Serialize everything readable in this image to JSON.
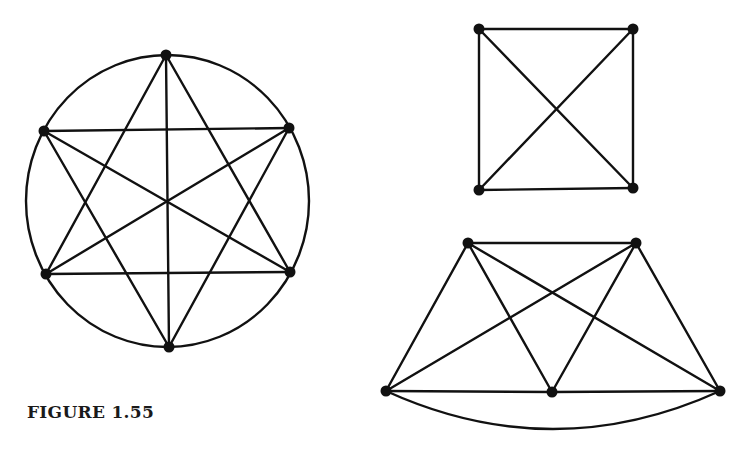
{
  "figure": {
    "caption": "FIGURE 1.55",
    "colors": {
      "ink": "#111111",
      "background": "#ffffff"
    }
  },
  "graphs": [
    {
      "id": "k6-circle",
      "description": "Complete graph on 6 vertices drawn inside a circle",
      "outer_ellipse": {
        "cx": 167.5,
        "cy": 201,
        "rx": 141.5,
        "ry": 146
      },
      "vertices": [
        {
          "id": "top",
          "x": 166,
          "y": 55
        },
        {
          "id": "upper-left",
          "x": 44,
          "y": 131
        },
        {
          "id": "upper-right",
          "x": 289,
          "y": 128
        },
        {
          "id": "lower-left",
          "x": 46,
          "y": 274
        },
        {
          "id": "lower-right",
          "x": 290,
          "y": 272
        },
        {
          "id": "bottom",
          "x": 169,
          "y": 347
        }
      ],
      "edges": [
        [
          "top",
          "lower-left"
        ],
        [
          "top",
          "lower-right"
        ],
        [
          "top",
          "bottom"
        ],
        [
          "upper-left",
          "upper-right"
        ],
        [
          "upper-left",
          "lower-right"
        ],
        [
          "upper-left",
          "bottom"
        ],
        [
          "upper-right",
          "lower-left"
        ],
        [
          "upper-right",
          "bottom"
        ],
        [
          "lower-left",
          "lower-right"
        ]
      ]
    },
    {
      "id": "k4-square",
      "description": "Complete graph on 4 vertices drawn as a square with diagonals",
      "vertices": [
        {
          "id": "top-left",
          "x": 479,
          "y": 29
        },
        {
          "id": "top-right",
          "x": 633,
          "y": 29
        },
        {
          "id": "bottom-left",
          "x": 479,
          "y": 190
        },
        {
          "id": "bottom-right",
          "x": 633,
          "y": 188
        }
      ],
      "edges": [
        [
          "top-left",
          "top-right"
        ],
        [
          "top-right",
          "bottom-right"
        ],
        [
          "bottom-right",
          "bottom-left"
        ],
        [
          "bottom-left",
          "top-left"
        ],
        [
          "top-left",
          "bottom-right"
        ],
        [
          "top-right",
          "bottom-left"
        ]
      ]
    },
    {
      "id": "k5-trapezoid",
      "description": "Complete graph on 5 vertices drawn as a trapezoid with a curved bottom edge",
      "vertices": [
        {
          "id": "top-left",
          "x": 468,
          "y": 243
        },
        {
          "id": "top-right",
          "x": 636,
          "y": 243
        },
        {
          "id": "bottom-left",
          "x": 386,
          "y": 391
        },
        {
          "id": "bottom-middle",
          "x": 552,
          "y": 392
        },
        {
          "id": "bottom-right",
          "x": 720,
          "y": 391
        }
      ],
      "edges": [
        [
          "top-left",
          "top-right"
        ],
        [
          "top-left",
          "bottom-left"
        ],
        [
          "top-left",
          "bottom-middle"
        ],
        [
          "top-left",
          "bottom-right"
        ],
        [
          "top-right",
          "bottom-left"
        ],
        [
          "top-right",
          "bottom-middle"
        ],
        [
          "top-right",
          "bottom-right"
        ],
        [
          "bottom-left",
          "bottom-middle"
        ],
        [
          "bottom-middle",
          "bottom-right"
        ]
      ],
      "curved_edges": [
        {
          "from": "bottom-left",
          "to": "bottom-right",
          "control": {
            "x": 553,
            "y": 467
          }
        }
      ]
    }
  ]
}
